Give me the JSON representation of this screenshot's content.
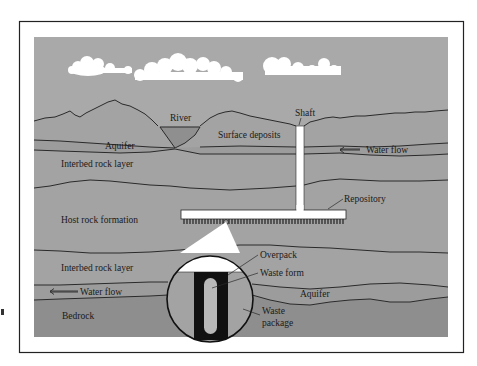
{
  "figure": {
    "colors": {
      "frame": "#222222",
      "sky": "#a8a8a8",
      "rock": "#a2a2a2",
      "aquifer": "#9c9c9c",
      "bedrock": "#8e8e8e",
      "river": "#8f8f8f",
      "line": "#2a2a2a",
      "structure": "#ffffff",
      "package": "#111111",
      "waste_form": "#b8b8b8"
    },
    "labels": {
      "river": "River",
      "shaft": "Shaft",
      "surface_deposits": "Surface deposits",
      "aquifer_upper": "Aquifer",
      "water_flow_upper": "Water flow",
      "interbed_upper": "Interbed rock layer",
      "repository": "Repository",
      "host_rock": "Host rock formation",
      "overpack": "Overpack",
      "waste_form": "Waste form",
      "interbed_lower": "Interbed rock layer",
      "water_flow_lower": "Water flow",
      "aquifer_lower": "Aquifer",
      "bedrock": "Bedrock",
      "waste_package_line1": "Waste",
      "waste_package_line2": "package"
    },
    "clouds": [
      {
        "name": "cloud-left"
      },
      {
        "name": "cloud-center"
      },
      {
        "name": "cloud-right"
      }
    ]
  }
}
